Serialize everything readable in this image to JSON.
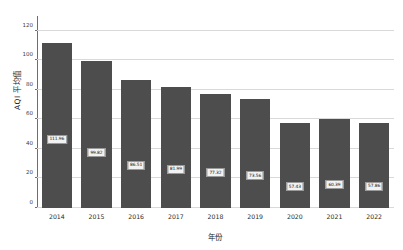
{
  "chart_data": {
    "type": "bar",
    "title": "",
    "xlabel": "年份",
    "ylabel": "AQI 平均值",
    "categories": [
      "2014",
      "2015",
      "2016",
      "2017",
      "2018",
      "2019",
      "2020",
      "2021",
      "2022"
    ],
    "values": [
      111.96,
      99.82,
      86.51,
      81.99,
      77.32,
      73.56,
      57.43,
      60.39,
      57.86
    ],
    "value_labels": [
      "111.96",
      "99.82",
      "86.51",
      "81.99",
      "77.32",
      "73.56",
      "57.43",
      "60.39",
      "57.86"
    ],
    "ylim": [
      0,
      130
    ],
    "yticks": [
      0,
      20,
      40,
      60,
      80,
      100,
      120
    ],
    "ytick_labels": [
      "0",
      "20",
      "40",
      "60",
      "80",
      "100",
      "120"
    ],
    "grid": true,
    "legend": "none",
    "bar_color": "#4d4d4d",
    "grid_color": "#d9d9d9",
    "label_box_fill": "#f2f2f2",
    "label_box_border": "#9a9a9a",
    "background": "#ffffff"
  }
}
